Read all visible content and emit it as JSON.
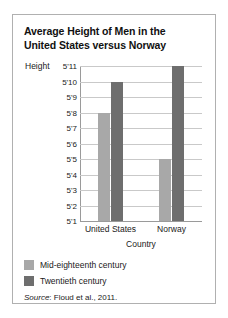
{
  "chart_data": {
    "type": "bar",
    "title": "Average Height of Men in the United States versus Norway",
    "title_line1": "Average Height of Men in the",
    "title_line2": "United States versus Norway",
    "xlabel": "Country",
    "ylabel": "Height",
    "categories": [
      "United States",
      "Norway"
    ],
    "series": [
      {
        "name": "Mid-eighteenth century",
        "color": "#a8a8a8",
        "values": [
          68,
          65
        ],
        "value_labels": [
          "5'8",
          "5'5"
        ]
      },
      {
        "name": "Twentieth century",
        "color": "#6e6e6e",
        "values": [
          70,
          71
        ],
        "value_labels": [
          "5'10",
          "5'11"
        ]
      }
    ],
    "ylim": [
      61,
      71
    ],
    "ytick_values": [
      71,
      70,
      69,
      68,
      67,
      66,
      65,
      64,
      63,
      62,
      61
    ],
    "ytick_labels": [
      "5'11",
      "5'10",
      "5'9",
      "5'8",
      "5'7",
      "5'6",
      "5'5",
      "5'4",
      "5'3",
      "5'2",
      "5'1"
    ],
    "grid": true,
    "legend_position": "below-plot-left",
    "unit": "inches"
  },
  "source": {
    "prefix": "Source",
    "text": ": Floud et al., 2011."
  }
}
